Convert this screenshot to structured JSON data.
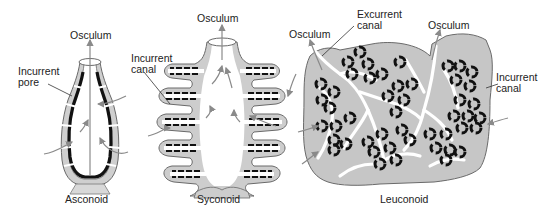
{
  "diagram": {
    "type": "sponge body plans",
    "colors": {
      "tissue": "#c8c8c8",
      "tissue_stroke": "#6a6a6a",
      "choanocyte": "#111111",
      "arrow": "#8a8a8a",
      "text": "#222222"
    },
    "panels": [
      {
        "id": "asconoid",
        "caption": "Asconoid",
        "labels": {
          "osculum": "Osculum",
          "incurrent_pore": "Incurrent\npore"
        }
      },
      {
        "id": "syconoid",
        "caption": "Syconoid",
        "labels": {
          "osculum": "Osculum",
          "incurrent_canal": "Incurrent\ncanal"
        }
      },
      {
        "id": "leuconoid",
        "caption": "Leuconoid",
        "labels": {
          "osculum_left": "Osculum",
          "excurrent_canal": "Excurrent\ncanal",
          "osculum_right": "Osculum",
          "incurrent_canal": "Incurrent\ncanal"
        }
      }
    ]
  }
}
